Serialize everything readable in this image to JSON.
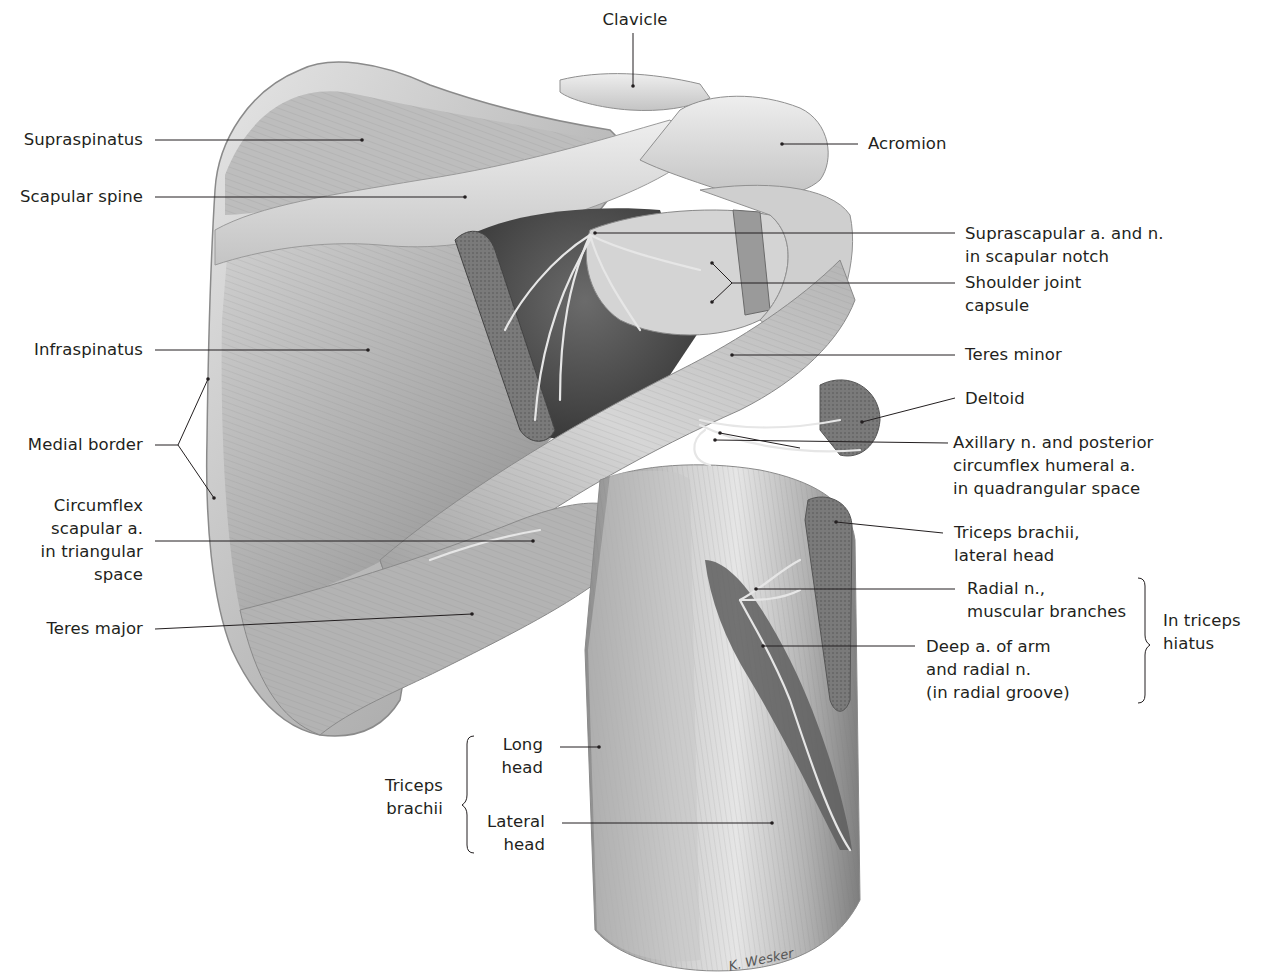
{
  "figure": {
    "signature": "K. Wesker",
    "palette": {
      "background": "#ffffff",
      "text": "#231f20",
      "leader": "#231f20",
      "muscle_light": "#d9d9d9",
      "muscle_mid": "#a8a8a8",
      "muscle_dark": "#5a5a5a",
      "cut_surface": "#6e6e6e"
    }
  },
  "labels": {
    "clavicle": {
      "lines": [
        "Clavicle"
      ]
    },
    "acromion": {
      "lines": [
        "Acromion"
      ]
    },
    "supraspinatus": {
      "lines": [
        "Supraspinatus"
      ]
    },
    "scapular_spine": {
      "lines": [
        "Scapular spine"
      ]
    },
    "suprascapular": {
      "lines": [
        "Suprascapular a. and n.",
        "in scapular notch"
      ]
    },
    "shoulder_capsule": {
      "lines": [
        "Shoulder joint",
        "capsule"
      ]
    },
    "infraspinatus": {
      "lines": [
        "Infraspinatus"
      ]
    },
    "teres_minor": {
      "lines": [
        "Teres minor"
      ]
    },
    "deltoid": {
      "lines": [
        "Deltoid"
      ]
    },
    "medial_border": {
      "lines": [
        "Medial border"
      ]
    },
    "axillary": {
      "lines": [
        "Axillary n. and posterior",
        "circumflex humeral a.",
        "in quadrangular space"
      ]
    },
    "circumflex_scapular": {
      "lines": [
        "Circumflex",
        "scapular a.",
        "in triangular",
        "space"
      ]
    },
    "triceps_lateral_head_top": {
      "lines": [
        "Triceps brachii,",
        "lateral head"
      ]
    },
    "radial_branches": {
      "lines": [
        "Radial n.,",
        "muscular branches"
      ]
    },
    "triceps_hiatus": {
      "lines": [
        "In triceps",
        "hiatus"
      ]
    },
    "deep_artery": {
      "lines": [
        "Deep a. of arm",
        "and radial n.",
        "(in radial groove)"
      ]
    },
    "teres_major": {
      "lines": [
        "Teres major"
      ]
    },
    "long_head": {
      "lines": [
        "Long",
        "head"
      ]
    },
    "triceps_brachii": {
      "lines": [
        "Triceps",
        "brachii"
      ]
    },
    "lateral_head": {
      "lines": [
        "Lateral",
        "head"
      ]
    }
  }
}
